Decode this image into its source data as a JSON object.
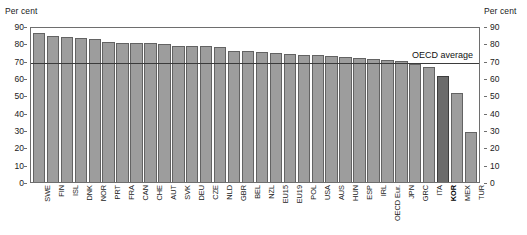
{
  "axis": {
    "unit_left": "Per cent",
    "unit_right": "Per cent",
    "ticks": [
      90,
      80,
      70,
      60,
      50,
      40,
      30,
      20,
      10,
      0
    ]
  },
  "annotation": {
    "oecd_average_label": "OECD average",
    "oecd_average_value": 70
  },
  "colors": {
    "bar_fill": "#9d9d9d",
    "bar_stroke": "#636363",
    "highlight_fill": "#6b6b6b",
    "highlight_stroke": "#3d3d3d",
    "frame": "#6e6e6e",
    "reference_line": "#3b3b3b",
    "background": "#ffffff"
  },
  "chart_data": {
    "type": "bar",
    "title": "",
    "xlabel": "",
    "ylabel": "Per cent",
    "ylim": [
      0,
      90
    ],
    "ytick_step": 10,
    "grid": false,
    "legend": "none",
    "highlight_category": "KOR",
    "reference_line": {
      "label": "OECD average",
      "value": 70
    },
    "categories": [
      "SWE",
      "FIN",
      "ISL",
      "DNK",
      "NOR",
      "PRT",
      "FRA",
      "CAN",
      "CHE",
      "AUT",
      "SVK",
      "DEU",
      "CZE",
      "NLD",
      "GBR",
      "BEL",
      "NZL",
      "EU15",
      "EU19",
      "POL",
      "USA",
      "AUS",
      "HUN",
      "ESP",
      "IRL",
      "OECD Eur.",
      "JPN",
      "GRC",
      "ITA",
      "KOR",
      "MEX",
      "TUR"
    ],
    "values": [
      87,
      85.5,
      85,
      84,
      83.5,
      82,
      81.5,
      81,
      81,
      80.5,
      79.5,
      79.5,
      79.5,
      79,
      76.5,
      76.5,
      76,
      75.5,
      75,
      74.5,
      74,
      73.5,
      73,
      72.5,
      72,
      71.5,
      71,
      69,
      67,
      62,
      52,
      29
    ]
  }
}
